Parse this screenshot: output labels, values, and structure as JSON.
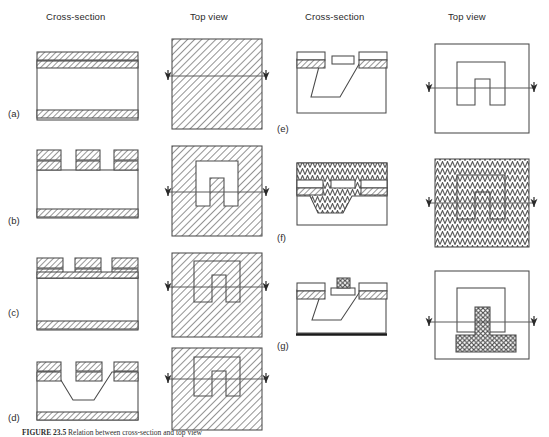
{
  "figure": {
    "caption_label": "FIGURE 23.5",
    "caption_text": "Relation between cross-section and top view",
    "columns": [
      {
        "id": "cross-section-left",
        "label": "Cross-section"
      },
      {
        "id": "top-view-left",
        "label": "Top view"
      },
      {
        "id": "cross-section-right",
        "label": "Cross-section"
      },
      {
        "id": "top-view-right",
        "label": "Top view"
      }
    ],
    "panels": [
      {
        "id": "a",
        "label": "(a)",
        "description": "Substrate with masking layers on both faces, unpatterned; top view fully hatched"
      },
      {
        "id": "b",
        "label": "(b)",
        "description": "Photoresist patterned into three blocks; top view shows U-shaped opening"
      },
      {
        "id": "c",
        "label": "(c)",
        "description": "Mask layer opened beneath resist; top view outlined U-shape in hatched field"
      },
      {
        "id": "d",
        "label": "(d)",
        "description": "Anisotropic etch forming sloped-wall trench"
      },
      {
        "id": "e",
        "label": "(e)",
        "description": "Deep trench with free-standing bridge; top view nested outlines"
      },
      {
        "id": "f",
        "label": "(f)",
        "description": "Conformal film deposited over entire structure, zigzag hatch"
      },
      {
        "id": "g",
        "label": "(g)",
        "description": "Released bridge with metal contact pad, cross-hatch fill"
      }
    ],
    "hatch_styles": [
      {
        "id": "diagonal",
        "name": "diagonal-hatch",
        "meaning": "masking / oxide layer"
      },
      {
        "id": "zigzag",
        "name": "zigzag-hatch",
        "meaning": "deposited conformal film"
      },
      {
        "id": "crosshatch",
        "name": "cross-hatch",
        "meaning": "metallization"
      }
    ],
    "colors": {
      "line": "#4a4a4a",
      "line_dark": "#1a1a1a",
      "hatch": "#7a7a7a",
      "background": "#ffffff",
      "text": "#2b2b2b"
    },
    "section_line": {
      "name": "section-cut-line",
      "arrow_count": 2,
      "direction": "horizontal"
    }
  }
}
